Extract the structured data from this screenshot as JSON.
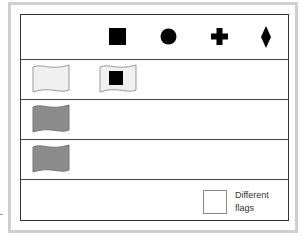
{
  "diagram": {
    "header_symbols": [
      {
        "name": "square",
        "glyph": "square"
      },
      {
        "name": "circle",
        "glyph": "circle"
      },
      {
        "name": "cross",
        "glyph": "plus"
      },
      {
        "name": "diamond",
        "glyph": "diamond"
      }
    ],
    "rows": [
      {
        "flags": [
          {
            "fill": "#f0f0f0",
            "symbol": null
          },
          {
            "fill": "#f0f0f0",
            "symbol": "square"
          }
        ]
      },
      {
        "flags": [
          {
            "fill": "#8c8c8c",
            "symbol": null
          }
        ]
      },
      {
        "flags": [
          {
            "fill": "#8c8c8c",
            "symbol": null
          }
        ]
      }
    ],
    "legend": {
      "line1": "Different",
      "line2": "flags"
    },
    "colors": {
      "frame": "#cfcfcf",
      "table_border": "#333333",
      "light_flag": "#f0f0f0",
      "dark_flag": "#8c8c8c",
      "symbol": "#000000"
    }
  }
}
